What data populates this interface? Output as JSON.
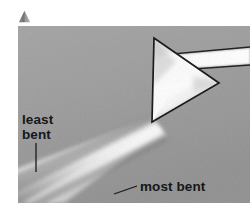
{
  "figure": {
    "kind": "photograph",
    "caption_marker_icon": "triangle-bullet-icon",
    "background_color": "#ffffff",
    "photo": {
      "background_color": "#9c9c9c",
      "subject": "white light dispersed by a triangular glass prism",
      "incoming_beam_color": "#ffffff",
      "prism_outline_color": "#101010"
    },
    "labels": {
      "least_bent_line1": "least",
      "least_bent_line2": "bent",
      "most_bent": "most bent"
    },
    "label_color": "#0b0b0b"
  }
}
